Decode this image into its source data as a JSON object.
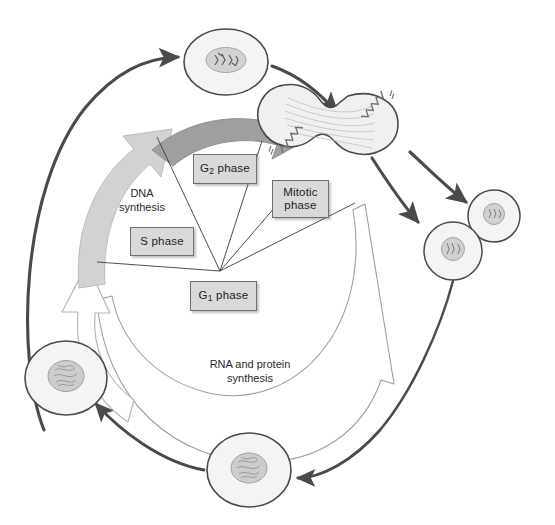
{
  "diagram": {
    "background_color": "#ffffff",
    "phase_boxes": [
      {
        "id": "g2",
        "label_main": "G",
        "label_sub": "2",
        "label_tail": " phase",
        "x": 193,
        "y": 154,
        "w": 62,
        "h": 28
      },
      {
        "id": "mitotic",
        "label_main": "Mitotic",
        "label_sub": "",
        "label_tail": "phase",
        "x": 272,
        "y": 180,
        "w": 55,
        "h": 36
      },
      {
        "id": "s",
        "label_main": "S phase",
        "label_sub": "",
        "label_tail": "",
        "x": 130,
        "y": 227,
        "w": 62,
        "h": 27
      },
      {
        "id": "g1",
        "label_main": "G",
        "label_sub": "1",
        "label_tail": " phase",
        "x": 190,
        "y": 281,
        "w": 65,
        "h": 28
      }
    ],
    "plain_labels": [
      {
        "id": "dna-synthesis",
        "text": "DNA\nsynthesis",
        "x": 107,
        "y": 186,
        "w": 70
      },
      {
        "id": "rna-protein-synthesis",
        "text": "RNA and protein\nsynthesis",
        "x": 185,
        "y": 357,
        "w": 130
      }
    ],
    "cells": [
      {
        "id": "cell-top-prophase",
        "cx": 226,
        "cy": 62,
        "rx": 42,
        "ry": 33,
        "nucleus_rx": 19,
        "nucleus_ry": 12,
        "stage": "prophase",
        "chromosomes": true
      },
      {
        "id": "cell-dividing-telophase",
        "cx": 380,
        "cy": 125,
        "stage": "telophase-cytokinesis",
        "shape": "dumbbell",
        "spindle": true
      },
      {
        "id": "cell-daughter-upper-right",
        "cx": 494,
        "cy": 216,
        "rx": 26,
        "ry": 25,
        "nucleus_rx": 10,
        "nucleus_ry": 10,
        "stage": "daughter"
      },
      {
        "id": "cell-daughter-lower-right",
        "cx": 453,
        "cy": 251,
        "rx": 29,
        "ry": 28,
        "nucleus_rx": 11,
        "nucleus_ry": 11,
        "stage": "daughter"
      },
      {
        "id": "cell-bottom-g1",
        "cx": 249,
        "cy": 470,
        "rx": 41,
        "ry": 36,
        "nucleus_rx": 17,
        "nucleus_ry": 14,
        "stage": "interphase"
      },
      {
        "id": "cell-left-g1",
        "cx": 66,
        "cy": 378,
        "rx": 40,
        "ry": 36,
        "nucleus_rx": 17,
        "nucleus_ry": 15,
        "stage": "interphase"
      }
    ],
    "arrows": [
      {
        "id": "arrow-g2-phase",
        "style": "thick-gray-arc",
        "color": "#9a9a9a",
        "from": "left-upper",
        "to": "top-right"
      },
      {
        "id": "arrow-s-phase-dna-synthesis",
        "style": "thick-lightgray-arc",
        "color": "#cccccc",
        "from": "lower-left",
        "to": "upper-right"
      },
      {
        "id": "arrow-g1-phase-outline",
        "style": "outline-white-arc",
        "color": "#ffffff",
        "from": "bottom",
        "to": "upper"
      },
      {
        "id": "arrow-rna-protein-arc",
        "style": "outline-white-arc-long",
        "color": "#ffffff",
        "from": "bottom-left",
        "to": "upper-right"
      },
      {
        "id": "arrow-outer-left-up",
        "style": "thin-dark-arc",
        "color": "#4a4a4a"
      },
      {
        "id": "arrow-top-to-dividing",
        "style": "thin-dark-arc",
        "color": "#4a4a4a"
      },
      {
        "id": "arrow-dividing-to-daughter-upper",
        "style": "thin-dark-arc",
        "color": "#4a4a4a"
      },
      {
        "id": "arrow-dividing-to-daughter-lower",
        "style": "thin-dark-arc",
        "color": "#4a4a4a"
      },
      {
        "id": "arrow-outer-right-down",
        "style": "thin-dark-arc",
        "color": "#4a4a4a"
      },
      {
        "id": "arrow-bottom-to-left-cell",
        "style": "thin-dark-arc",
        "color": "#4a4a4a"
      }
    ],
    "colors": {
      "box_fill": "#d9d9d9",
      "box_border": "#6e6e6e",
      "text": "#1d1d1d",
      "cell_fill": "#f2f2f2",
      "cell_stroke": "#5a5a5a",
      "nucleus_fill": "#cfcfcf",
      "nucleus_stroke": "#9a9a9a",
      "dark_arrow": "#4a4a4a",
      "gray_arrow": "#9a9a9a",
      "light_arrow": "#cfcfcf",
      "white_arrow_stroke": "#bdbdbd"
    }
  }
}
